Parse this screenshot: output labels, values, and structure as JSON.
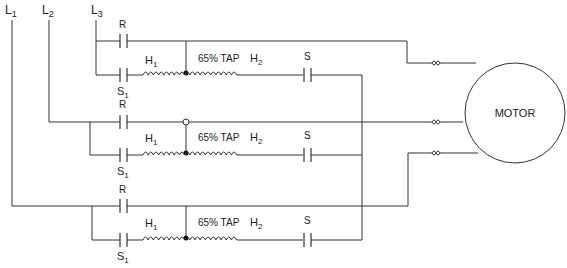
{
  "diagram": {
    "type": "autotransformer reduced-voltage motor starter schematic",
    "lines": {
      "L1": {
        "letter": "L",
        "sub": "1"
      },
      "L2": {
        "letter": "L",
        "sub": "2"
      },
      "L3": {
        "letter": "L",
        "sub": "3"
      }
    },
    "motor": {
      "label": "MOTOR"
    },
    "phases": [
      {
        "run_contact": "R",
        "start_contact_1": {
          "letter": "S",
          "sub": "1"
        },
        "start_contact_2": "S",
        "coil_start": {
          "letter": "H",
          "sub": "1"
        },
        "coil_end": {
          "letter": "H",
          "sub": "2"
        },
        "tap_label": "65% TAP"
      },
      {
        "run_contact": "R",
        "start_contact_1": {
          "letter": "S",
          "sub": "1"
        },
        "start_contact_2": "S",
        "coil_start": {
          "letter": "H",
          "sub": "1"
        },
        "coil_end": {
          "letter": "H",
          "sub": "2"
        },
        "tap_label": "65% TAP"
      },
      {
        "run_contact": "R",
        "start_contact_1": {
          "letter": "S",
          "sub": "1"
        },
        "start_contact_2": "S",
        "coil_start": {
          "letter": "H",
          "sub": "1"
        },
        "coil_end": {
          "letter": "H",
          "sub": "2"
        },
        "tap_label": "65% TAP"
      }
    ],
    "fuses": 3,
    "colors": {
      "line": "#333333",
      "background": "#ffffff"
    }
  }
}
